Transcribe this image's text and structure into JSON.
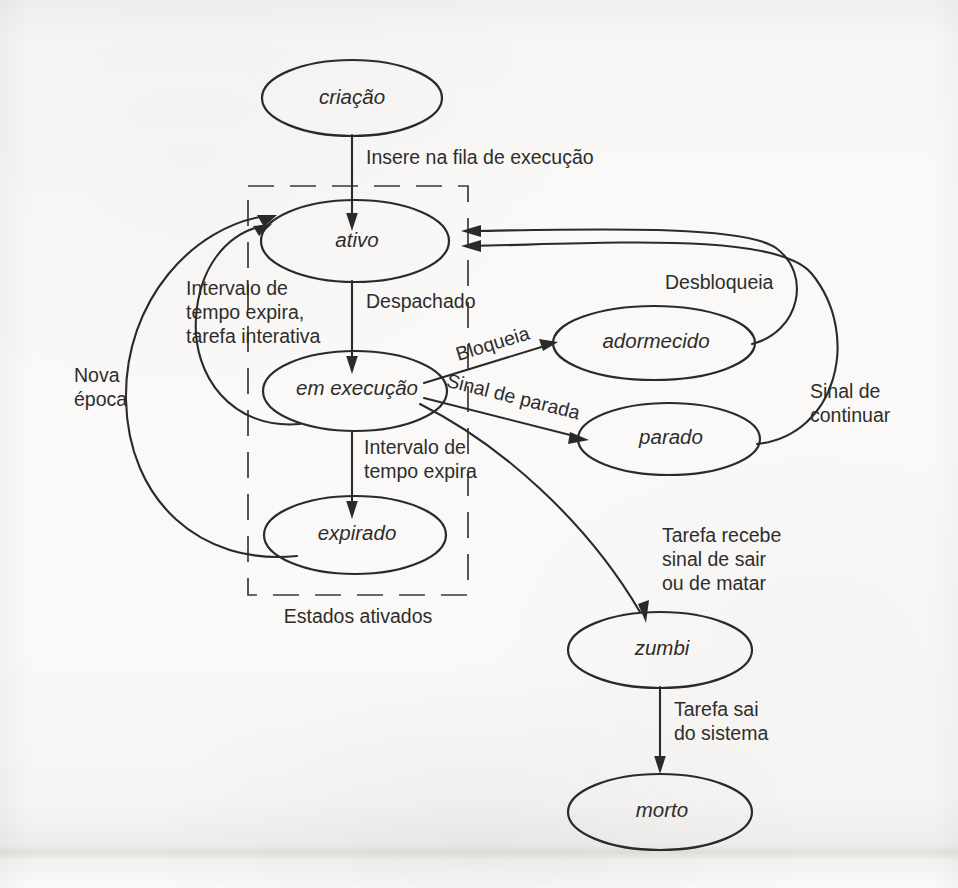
{
  "figure": {
    "kind": "state-transition-diagram",
    "language": "pt-BR",
    "ink_color": "#2b2a28",
    "paper_color": "#f8f7f5"
  },
  "states": {
    "criacao": "criação",
    "ativo": "ativo",
    "em_execucao": "em execução",
    "expirado": "expirado",
    "adormecido": "adormecido",
    "parado": "parado",
    "zumbi": "zumbi",
    "morto": "morto"
  },
  "transitions": {
    "insere_na_fila": "Insere na fila de execução",
    "despachado": "Despachado",
    "intervalo_interativa_l1": "Intervalo de",
    "intervalo_interativa_l2": "tempo expira,",
    "intervalo_interativa_l3": "tarefa interativa",
    "intervalo_expira_l1": "Intervalo de",
    "intervalo_expira_l2": "tempo expira",
    "nova_epoca_l1": "Nova",
    "nova_epoca_l2": "época",
    "bloqueia": "Bloqueia",
    "desbloqueia": "Desbloqueia",
    "sinal_de_parada": "Sinal de parada",
    "sinal_continuar_l1": "Sinal de",
    "sinal_continuar_l2": "continuar",
    "tarefa_sinal_l1": "Tarefa recebe",
    "tarefa_sinal_l2": "sinal de sair",
    "tarefa_sinal_l3": "ou de matar",
    "tarefa_sai_l1": "Tarefa sai",
    "tarefa_sai_l2": "do sistema"
  },
  "groups": {
    "estados_ativados": "Estados ativados"
  }
}
